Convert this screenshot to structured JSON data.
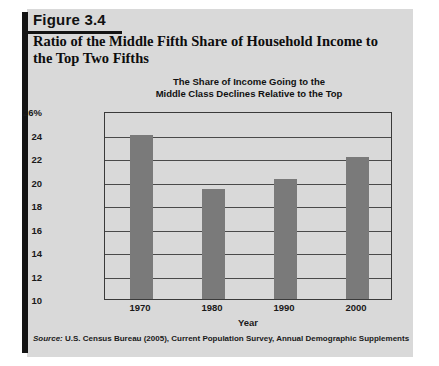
{
  "figure": {
    "label": "Figure 3.4",
    "title": "Ratio of the Middle Fifth Share of Household Income to the Top Two Fifths",
    "source_prefix": "Source:",
    "source_text": " U.S. Census Bureau (2005), Current Population Survey, Annual Demographic Supplements"
  },
  "chart_data": {
    "type": "bar",
    "title": "The Share of Income Going to the\nMiddle Class Declines Relative to the Top",
    "title_line1": "The Share of Income Going to the",
    "title_line2": "Middle Class Declines Relative to the Top",
    "categories": [
      "1970",
      "1980",
      "1990",
      "2000"
    ],
    "values": [
      24.0,
      19.4,
      20.2,
      22.1
    ],
    "series": [
      {
        "name": "Middle fifth share to top two fifths",
        "values": [
          24.0,
          19.4,
          20.2,
          22.1
        ]
      }
    ],
    "xlabel": "Year",
    "ylabel": "Percentage",
    "ylim": [
      10,
      26
    ],
    "ytick_values": [
      10,
      12,
      14,
      16,
      18,
      20,
      22,
      24,
      26
    ],
    "ytick_labels": [
      "10",
      "12",
      "14",
      "16",
      "18",
      "20",
      "22",
      "24",
      "26%"
    ],
    "grid": true,
    "legend": "none",
    "bar_color": "#7a7a7a",
    "plot_bg": "#d9d9d9",
    "axis_color": "#3a3a3a"
  }
}
